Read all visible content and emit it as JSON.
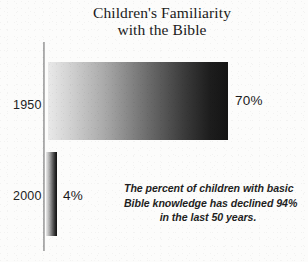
{
  "chart_data": {
    "type": "bar",
    "orientation": "horizontal",
    "title": "Children's Familiarity with the Bible",
    "title_lines": [
      "Children's Familiarity",
      "with the Bible"
    ],
    "categories": [
      "1950",
      "2000"
    ],
    "values": [
      70,
      4
    ],
    "value_labels": [
      "70%",
      "4%"
    ],
    "unit": "%",
    "xlabel": "",
    "ylabel": "",
    "xlim": [
      0,
      70
    ],
    "grid": false,
    "legend": false,
    "bar_fill": "linear gradient light-gray to black, left to right",
    "colors": {
      "bar_start": "#e9e9e9",
      "bar_end": "#141414",
      "axis": "#9a9a9a",
      "text": "#1b1b1b",
      "background": "#fcfcfb"
    },
    "annotation": "The percent of children with basic Bible knowledge has declined 94% in the last 50 years.",
    "annotation_lines": [
      "The percent of children with basic",
      "Bible knowledge has declined 94%",
      "in the last 50 years."
    ]
  }
}
